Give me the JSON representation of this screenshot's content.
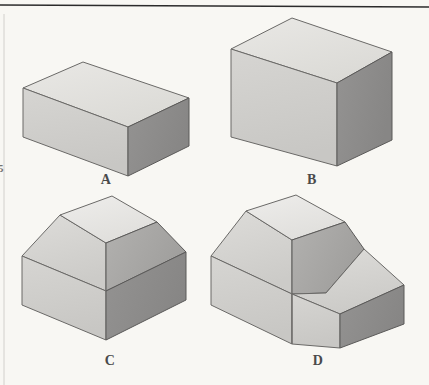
{
  "page": {
    "background_color": "#f8f7f3",
    "width": 429,
    "height": 385
  },
  "rules": {
    "top_rule": {
      "name": "top-horizontal-rule",
      "color": "#2b2b2b",
      "x1": 0,
      "y1": 5,
      "x2": 429,
      "y2": 7
    },
    "left_rule": {
      "name": "left-vertical-rule",
      "color": "#c8c6c2",
      "x1": 4,
      "y1": 12,
      "x2": 4,
      "y2": 385
    }
  },
  "palette": {
    "top_face": "#e2e1dd",
    "front_face": "#cfcecb",
    "right_face": "#8e8d8b",
    "slope_face": "#a9a8a6",
    "slope_face_light": "#d4d3d0",
    "outline": "#5e5d5b",
    "label_color": "#4a4a4a"
  },
  "figures": [
    {
      "id": "A",
      "label": "A",
      "name": "figure-a-rectangular-block",
      "description": "Low rectangular prism block, isometric view",
      "label_position": {
        "x": 94,
        "y": 172
      },
      "faces": {
        "top": "23,88 83,62 189,98 128,127",
        "front": "23,88 128,127 128,176 23,137",
        "right": "128,127 189,98 189,146 128,176"
      }
    },
    {
      "id": "B",
      "label": "B",
      "name": "figure-b-tall-block",
      "description": "Taller rectangular prism block, isometric view",
      "label_position": {
        "x": 300,
        "y": 172
      },
      "faces": {
        "top": "231,49 292,18 392,52 337,83",
        "front": "231,49 337,83 337,166 231,137",
        "right": "337,83 392,52 392,140 337,166"
      }
    },
    {
      "id": "C",
      "label": "C",
      "name": "figure-c-barn-shaped-block",
      "description": "Block with a truncated roof ridge on top of a rectangular base, isometric view",
      "label_position": {
        "x": 98,
        "y": 353
      },
      "faces": {
        "ridge_top": "60,215 112,196 157,222 106,243",
        "roof_left": "22,256 60,215 106,243 106,291",
        "roof_right": "106,243 157,222 186,252 106,291",
        "base_front": "22,256 106,291 106,340 22,305",
        "base_right": "106,291 186,252 186,300 106,340"
      }
    },
    {
      "id": "D",
      "label": "D",
      "name": "figure-d-stepped-barn-block",
      "description": "Barn-shaped block like C but with a lower stepped ledge added on the right side, isometric view",
      "label_position": {
        "x": 306,
        "y": 353
      },
      "faces": {
        "ridge_top": "246,211 296,195 345,222 292,240",
        "roof_left": "211,256 246,211 292,240 292,294",
        "roof_right": "292,240 345,222 364,249 326,293 292,294",
        "base_front": "211,256 292,294 292,344 211,305",
        "step_top": "292,294 364,249 404,285 340,314",
        "step_front": "292,294 340,314 340,348 292,344",
        "step_right": "340,314 404,285 404,324 340,348"
      }
    }
  ],
  "edge_marks": {
    "left_margin_mark": "5"
  }
}
